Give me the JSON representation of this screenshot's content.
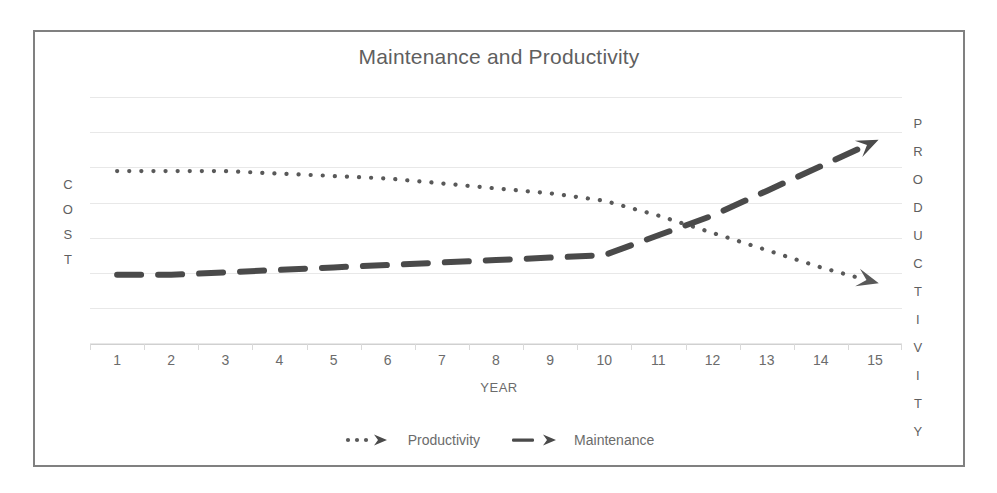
{
  "chart_data": {
    "type": "line",
    "title": "Maintenance and Productivity",
    "xlabel": "YEAR",
    "ylabel_left": "COST",
    "ylabel_right": "PRODUCTIVITY",
    "categories": [
      "1",
      "2",
      "3",
      "4",
      "5",
      "6",
      "7",
      "8",
      "9",
      "10",
      "11",
      "12",
      "13",
      "14",
      "15"
    ],
    "x": [
      1,
      2,
      3,
      4,
      5,
      6,
      7,
      8,
      9,
      10,
      11,
      12,
      13,
      14,
      15
    ],
    "xlim": [
      1,
      15
    ],
    "ylim": [
      0,
      100
    ],
    "grid": true,
    "gridlines_count": 8,
    "legend_position": "bottom",
    "series": [
      {
        "name": "Productivity",
        "style": "dotted",
        "color": "#595959",
        "arrow_end": true,
        "values": [
          70,
          70,
          70,
          69,
          68,
          67,
          65,
          63,
          61,
          58,
          52,
          45,
          38,
          31,
          25
        ]
      },
      {
        "name": "Maintenance",
        "style": "dashed",
        "color": "#4a4a4a",
        "arrow_end": true,
        "values": [
          28,
          28,
          29,
          30,
          31,
          32,
          33,
          34,
          35,
          36,
          44,
          52,
          62,
          72,
          82
        ]
      }
    ]
  },
  "chart": {
    "title": "Maintenance and Productivity",
    "x_axis_title": "YEAR",
    "y_axis_left_letters": [
      "C",
      "O",
      "S",
      "T"
    ],
    "y_axis_right_letters": [
      "P",
      "R",
      "O",
      "D",
      "U",
      "C",
      "T",
      "I",
      "V",
      "I",
      "T",
      "Y"
    ],
    "x_tick_labels": [
      "1",
      "2",
      "3",
      "4",
      "5",
      "6",
      "7",
      "8",
      "9",
      "10",
      "11",
      "12",
      "13",
      "14",
      "15"
    ],
    "legend": [
      {
        "label": "Productivity",
        "marker": "dotted-arrow-marker"
      },
      {
        "label": "Maintenance",
        "marker": "dashed-arrow-marker"
      }
    ],
    "colors": {
      "title": "#5f5f5f",
      "axis_text": "#6b6b6b",
      "gridline": "#e8e8e8",
      "border": "#808080",
      "productivity_line": "#595959",
      "maintenance_line": "#4a4a4a"
    }
  }
}
